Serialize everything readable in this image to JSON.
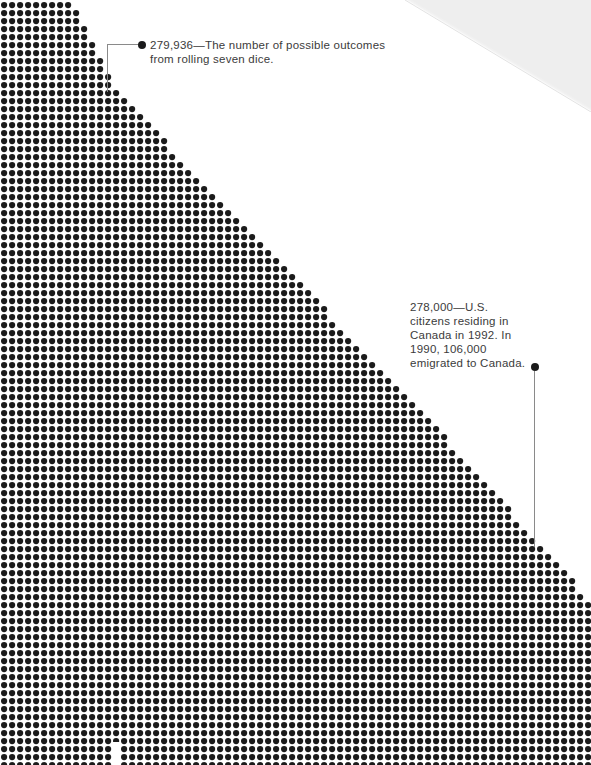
{
  "page": {
    "width": 591,
    "height": 765,
    "background_color": "#ffffff",
    "dot_color": "#1b1b1b",
    "text_color": "#3b3b3b",
    "leader_color": "#8a8a8a",
    "corner_fold_color": "#eeeeee"
  },
  "annotations": [
    {
      "id": "dice",
      "bullet": true,
      "leader": "elbow",
      "text": "279,936—The number of possible outcomes from rolling seven dice.",
      "value": "279,936",
      "description": "The number of possible outcomes from rolling seven dice."
    },
    {
      "id": "canada",
      "bullet": true,
      "leader": "vertical",
      "text": "278,000—U.S. citizens residing in Canada in 1992. In 1990, 106,000 emigrated to Canada.",
      "value": "278,000",
      "description": "U.S. citizens residing in Canada in 1992. In 1990, 106,000 emigrated to Canada."
    }
  ],
  "chart_data": {
    "type": "scatter",
    "title": "",
    "subtitle": "",
    "xlabel": "",
    "ylabel": "",
    "grid": true,
    "legend_position": "none",
    "dot_pitch_x": 8,
    "dot_pitch_y": 8,
    "dot_diameter": 6.2,
    "dot_color": "#1b1b1b",
    "columns": 74,
    "rows": 96,
    "field": {
      "origin_x": 1,
      "origin_y": 2,
      "edge_points": [
        {
          "y": 0,
          "x": 72
        },
        {
          "y": 90,
          "x": 118
        },
        {
          "y": 200,
          "x": 222
        },
        {
          "y": 300,
          "x": 318
        },
        {
          "y": 330,
          "x": 346
        },
        {
          "y": 430,
          "x": 440
        },
        {
          "y": 520,
          "x": 520
        },
        {
          "y": 600,
          "x": 591
        },
        {
          "y": 765,
          "x": 591
        }
      ]
    },
    "callouts": [
      {
        "label": "279,936",
        "note": "The number of possible outcomes from rolling seven dice.",
        "x": 142,
        "y": 45
      },
      {
        "label": "278,000",
        "note": "U.S. citizens residing in Canada in 1992. In 1990, 106,000 emigrated to Canada.",
        "x": 535,
        "y": 367
      }
    ]
  }
}
